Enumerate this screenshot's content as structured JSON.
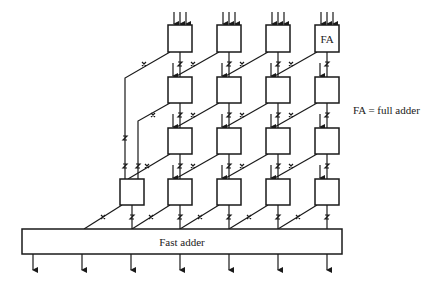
{
  "diagram": {
    "cell_label": "FA",
    "legend": "FA = full adder",
    "fast_adder_label": "Fast adder",
    "rows": 4,
    "columns": 4,
    "bottom_row_columns": 5,
    "outputs": 7,
    "colors": {
      "stroke": "#1a1a1a",
      "background": "#ffffff"
    }
  }
}
